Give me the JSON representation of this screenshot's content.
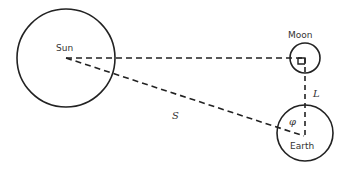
{
  "diagram": {
    "type": "geometry",
    "bodies": {
      "sun": {
        "label": "Sun"
      },
      "moon": {
        "label": "Moon"
      },
      "earth": {
        "label": "Earth"
      }
    },
    "labels": {
      "sun_earth_distance": "S",
      "earth_moon_distance": "L",
      "angle": "φ"
    },
    "colors": {
      "stroke": "#222222",
      "text": "#333333",
      "background": "#ffffff"
    }
  }
}
